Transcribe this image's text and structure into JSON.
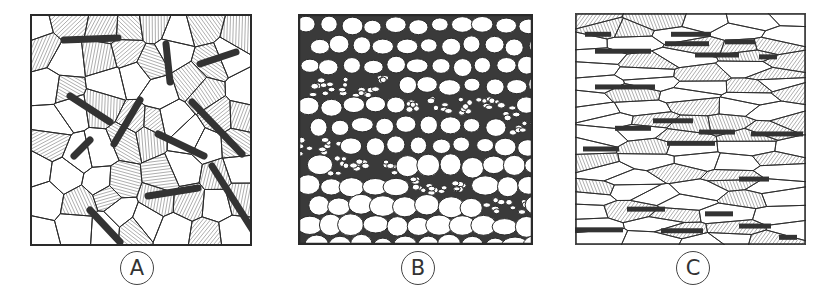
{
  "figure": {
    "panels": [
      {
        "id": "A",
        "label": "A",
        "description": "Equiaxed grains with hatched (lamellar) regions and randomly oriented dark needle-like inclusions"
      },
      {
        "id": "B",
        "label": "B",
        "description": "Rounded polygonal grains with thick boundaries, bands of fine grains running diagonally"
      },
      {
        "id": "C",
        "label": "C",
        "description": "Elongated flattened grains with hatched regions and horizontally aligned dark stringer inclusions"
      }
    ],
    "colors": {
      "ink": "#2a2a2a",
      "hatch": "#777777",
      "inclusion": "#333333",
      "background": "#ffffff"
    }
  }
}
